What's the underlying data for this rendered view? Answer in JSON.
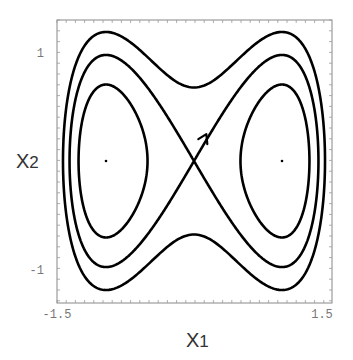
{
  "chart_data": {
    "type": "line",
    "title": "",
    "xlabel": "X1",
    "ylabel": "X2",
    "xlim": [
      -1.5,
      1.5
    ],
    "ylim": [
      -1.3,
      1.3
    ],
    "x_ticks": [
      {
        "value": -1.5,
        "label": "-1.5"
      },
      {
        "value": 1.5,
        "label": "1.5"
      }
    ],
    "y_ticks": [
      {
        "value": 1,
        "label": "1"
      },
      {
        "value": -1,
        "label": "-1"
      }
    ],
    "grid": false,
    "legend": null,
    "series": [
      {
        "name": "outer orbit",
        "energy": 0.12,
        "shape": "single closed curve enclosing both wells"
      },
      {
        "name": "separatrix",
        "energy": 0.0,
        "shape": "figure-eight through origin",
        "arrow": {
          "x1": 0.12,
          "x2": 0.35,
          "direction": "up-right"
        }
      },
      {
        "name": "inner orbit left",
        "energy": -0.12,
        "shape": "closed orbit around (-1, 0)"
      },
      {
        "name": "inner orbit right",
        "energy": -0.12,
        "shape": "closed orbit around (1, 0)"
      }
    ],
    "fixed_points": [
      {
        "x1": -1,
        "x2": 0,
        "type": "center"
      },
      {
        "x1": 1,
        "x2": 0,
        "type": "center"
      }
    ]
  },
  "labels": {
    "xlabel_main": "X",
    "xlabel_sub": "1",
    "ylabel_main": "X",
    "ylabel_sub": "2",
    "xtick_left": "-1.5",
    "xtick_right": "1.5",
    "ytick_top": "1",
    "ytick_bottom": "-1"
  },
  "style": {
    "curve_color": "#000000",
    "frame_color": "#888888",
    "text_color": "#777777"
  }
}
